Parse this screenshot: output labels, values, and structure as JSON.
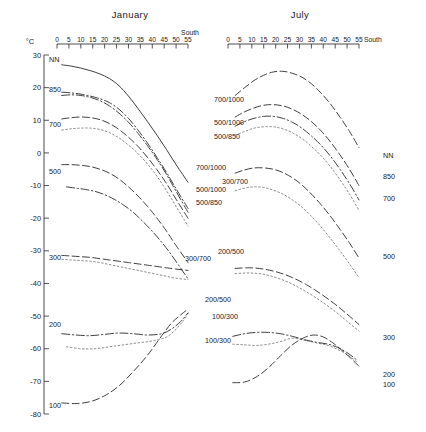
{
  "figure": {
    "unit_label": "°C",
    "panels": [
      {
        "name": "January",
        "title": "January",
        "south_label": "South"
      },
      {
        "name": "July",
        "title": "July",
        "south_label": "South"
      }
    ]
  },
  "chart_data": {
    "type": "line",
    "title": "",
    "xlabel": "South",
    "ylabel": "°C",
    "xlim": [
      0,
      55
    ],
    "ylim": [
      -80,
      30
    ],
    "grid": false,
    "legend": "inline-labels",
    "x_ticks": [
      0,
      5,
      10,
      15,
      20,
      25,
      30,
      35,
      40,
      45,
      50,
      55
    ],
    "y_ticks": [
      30,
      20,
      10,
      0,
      -10,
      -20,
      -30,
      -40,
      -50,
      -60,
      -70,
      -80
    ],
    "panels": [
      {
        "name": "January",
        "left_labels": [
          "NN",
          "850",
          "700",
          "500",
          "300",
          "200",
          "100"
        ],
        "series": [
          {
            "name": "NN",
            "style": "solid",
            "x": [
              2,
              6,
              10,
              14,
              18,
              22,
              26,
              30,
              34,
              38,
              42,
              46,
              50,
              55
            ],
            "y": [
              27.0,
              26.6,
              26.0,
              25.2,
              24.2,
              22.8,
              20.6,
              17.4,
              13.6,
              9.6,
              5.4,
              1.0,
              -3.6,
              -9.0
            ]
          },
          {
            "name": "850",
            "style": "dashdot",
            "x": [
              2,
              6,
              10,
              14,
              18,
              22,
              26,
              30,
              34,
              38,
              42,
              46,
              50,
              55
            ],
            "y": [
              18.6,
              18.4,
              18.0,
              17.4,
              16.6,
              15.4,
              13.4,
              10.6,
              7.0,
              3.0,
              -1.4,
              -6.0,
              -11.0,
              -17.0
            ]
          },
          {
            "name": "700/1000",
            "style": "dashdot",
            "x": [
              2,
              6,
              10,
              14,
              18,
              22,
              26,
              30,
              34,
              38,
              42,
              46,
              50,
              55
            ],
            "y": [
              17.6,
              17.8,
              17.6,
              17.0,
              16.0,
              14.4,
              12.2,
              9.4,
              6.0,
              2.2,
              -2.0,
              -6.6,
              -11.8,
              -18.2
            ]
          },
          {
            "name": "700",
            "style": "longdash",
            "x": [
              2,
              6,
              10,
              14,
              18,
              22,
              26,
              30,
              34,
              38,
              42,
              46,
              50,
              55
            ],
            "y": [
              10.4,
              10.8,
              11.0,
              10.8,
              10.2,
              9.0,
              7.2,
              4.8,
              2.0,
              -1.4,
              -5.2,
              -9.4,
              -14.2,
              -20.0
            ]
          },
          {
            "name": "500/1000",
            "style": "dotted",
            "x": [
              2,
              6,
              10,
              14,
              18,
              22,
              26,
              30,
              34,
              38,
              42,
              46,
              50,
              55
            ],
            "y": [
              7.0,
              7.4,
              7.6,
              7.6,
              7.2,
              6.2,
              4.6,
              2.4,
              -0.2,
              -3.4,
              -7.2,
              -11.6,
              -16.4,
              -22.4
            ]
          },
          {
            "name": "500",
            "style": "longdash",
            "x": [
              2,
              6,
              10,
              14,
              18,
              22,
              26,
              30,
              34,
              38,
              42,
              46,
              50,
              55
            ],
            "y": [
              -3.6,
              -3.6,
              -3.8,
              -4.2,
              -5.0,
              -6.2,
              -8.0,
              -10.4,
              -13.2,
              -16.4,
              -20.0,
              -24.0,
              -28.4,
              -33.6
            ]
          },
          {
            "name": "500/850",
            "style": "dashdot",
            "x": [
              4,
              8,
              12,
              16,
              20,
              24,
              28,
              32,
              36,
              40,
              44,
              48,
              52,
              55
            ],
            "y": [
              -10.4,
              -10.8,
              -11.2,
              -11.8,
              -12.8,
              -14.2,
              -16.0,
              -18.2,
              -21.0,
              -24.0,
              -27.4,
              -31.2,
              -35.4,
              -38.6
            ]
          },
          {
            "name": "300",
            "style": "longdash",
            "x": [
              2,
              6,
              10,
              14,
              18,
              22,
              26,
              30,
              34,
              38,
              42,
              46,
              50,
              55
            ],
            "y": [
              -31.4,
              -31.6,
              -31.8,
              -32.0,
              -32.4,
              -32.8,
              -33.2,
              -33.6,
              -34.0,
              -34.4,
              -34.8,
              -35.2,
              -35.6,
              -36.0
            ]
          },
          {
            "name": "300/700",
            "style": "dotted",
            "x": [
              2,
              6,
              10,
              14,
              18,
              22,
              26,
              30,
              34,
              38,
              42,
              46,
              50,
              55
            ],
            "y": [
              -32.6,
              -32.8,
              -33.0,
              -33.2,
              -33.6,
              -34.2,
              -34.8,
              -35.4,
              -36.0,
              -36.6,
              -37.2,
              -37.8,
              -38.4,
              -38.8
            ]
          },
          {
            "name": "200",
            "style": "dashdot",
            "x": [
              2,
              8,
              14,
              20,
              26,
              32,
              38,
              44,
              48,
              52,
              55
            ],
            "y": [
              -55.4,
              -55.8,
              -56.0,
              -55.6,
              -55.2,
              -55.4,
              -55.8,
              -55.4,
              -54.0,
              -51.6,
              -49.0
            ]
          },
          {
            "name": "200/500",
            "style": "dotted",
            "x": [
              4,
              10,
              16,
              22,
              28,
              34,
              40,
              46,
              50,
              53,
              55
            ],
            "y": [
              -59.4,
              -60.0,
              -60.0,
              -59.4,
              -58.8,
              -58.2,
              -57.6,
              -56.4,
              -54.0,
              -51.4,
              -49.2
            ]
          },
          {
            "name": "100",
            "style": "longdash",
            "x": [
              2,
              8,
              14,
              20,
              26,
              32,
              38,
              44,
              48,
              51,
              54
            ],
            "y": [
              -76.6,
              -76.8,
              -76.2,
              -74.4,
              -71.4,
              -67.0,
              -62.0,
              -56.0,
              -52.2,
              -50.2,
              -48.4
            ]
          }
        ],
        "inline_labels": [
          {
            "text": "700/1000",
            "x": 214,
            "y": 102
          },
          {
            "text": "500/1000",
            "x": 214,
            "y": 125
          },
          {
            "text": "500/850",
            "x": 214,
            "y": 139
          },
          {
            "text": "700/1000",
            "x": 196,
            "y": 170
          },
          {
            "text": "300/700",
            "x": 222,
            "y": 184
          },
          {
            "text": "500/1000",
            "x": 196,
            "y": 192
          },
          {
            "text": "500/850",
            "x": 196,
            "y": 205
          },
          {
            "text": "200/500",
            "x": 218,
            "y": 254
          },
          {
            "text": "300/700",
            "x": 185,
            "y": 261
          },
          {
            "text": "200/500",
            "x": 205,
            "y": 302
          },
          {
            "text": "100/300",
            "x": 212,
            "y": 319
          },
          {
            "text": "100/300",
            "x": 205,
            "y": 343
          }
        ]
      },
      {
        "name": "July",
        "right_labels": [
          "NN",
          "850",
          "700",
          "500",
          "300",
          "200",
          "100"
        ],
        "series": [
          {
            "name": "NN",
            "style": "longdash",
            "x": [
              3,
              7,
              11,
              15,
              19,
              23,
              27,
              31,
              35,
              39,
              43,
              47,
              51,
              55
            ],
            "y": [
              17.6,
              20.0,
              22.2,
              23.8,
              24.8,
              25.0,
              24.4,
              23.2,
              21.2,
              18.4,
              15.0,
              11.0,
              6.6,
              1.6
            ]
          },
          {
            "name": "850",
            "style": "longdash",
            "x": [
              3,
              7,
              11,
              15,
              19,
              23,
              27,
              31,
              35,
              39,
              43,
              47,
              51,
              55
            ],
            "y": [
              11.0,
              12.6,
              13.8,
              14.6,
              14.8,
              14.4,
              13.4,
              11.8,
              9.6,
              6.8,
              3.4,
              -0.6,
              -5.0,
              -10.0
            ]
          },
          {
            "name": "700",
            "style": "dashdot",
            "x": [
              3,
              7,
              11,
              15,
              19,
              23,
              27,
              31,
              35,
              39,
              43,
              47,
              51,
              55
            ],
            "y": [
              8.2,
              9.6,
              10.6,
              11.2,
              11.2,
              10.6,
              9.4,
              7.6,
              5.2,
              2.4,
              -1.0,
              -5.0,
              -9.4,
              -14.4
            ]
          },
          {
            "name": "700b",
            "style": "dotted",
            "x": [
              3,
              7,
              11,
              15,
              19,
              23,
              27,
              31,
              35,
              39,
              43,
              47,
              51,
              55
            ],
            "y": [
              5.4,
              6.6,
              7.6,
              8.0,
              8.0,
              7.4,
              6.2,
              4.4,
              2.0,
              -0.8,
              -4.2,
              -8.2,
              -12.6,
              -17.6
            ]
          },
          {
            "name": "500",
            "style": "longdash",
            "x": [
              3,
              7,
              11,
              15,
              19,
              23,
              27,
              31,
              35,
              39,
              43,
              47,
              51,
              55
            ],
            "y": [
              -6.2,
              -5.2,
              -4.6,
              -4.6,
              -5.0,
              -6.0,
              -7.6,
              -9.8,
              -12.6,
              -15.8,
              -19.4,
              -23.4,
              -27.6,
              -32.2
            ]
          },
          {
            "name": "500b",
            "style": "dotted",
            "x": [
              3,
              7,
              11,
              15,
              19,
              23,
              27,
              31,
              35,
              39,
              43,
              47,
              51,
              55
            ],
            "y": [
              -11.6,
              -10.8,
              -10.4,
              -10.6,
              -11.4,
              -12.6,
              -14.4,
              -16.6,
              -19.4,
              -22.6,
              -26.2,
              -30.0,
              -34.0,
              -38.2
            ]
          },
          {
            "name": "300",
            "style": "longdash",
            "x": [
              3,
              9,
              15,
              21,
              27,
              33,
              39,
              45,
              50,
              55
            ],
            "y": [
              -35.4,
              -35.2,
              -35.6,
              -36.6,
              -38.2,
              -40.4,
              -43.2,
              -46.4,
              -49.4,
              -52.6
            ]
          },
          {
            "name": "300b",
            "style": "dotted",
            "x": [
              3,
              9,
              15,
              21,
              27,
              33,
              39,
              45,
              50,
              55
            ],
            "y": [
              -37.0,
              -36.8,
              -37.2,
              -38.4,
              -40.2,
              -42.6,
              -45.4,
              -48.6,
              -51.6,
              -54.6
            ]
          },
          {
            "name": "200",
            "style": "dashdot",
            "x": [
              2,
              7,
              12,
              17,
              22,
              27,
              32,
              37,
              42,
              46,
              50,
              54
            ],
            "y": [
              -56.2,
              -55.4,
              -55.0,
              -55.0,
              -55.4,
              -56.2,
              -57.2,
              -58.0,
              -58.6,
              -59.6,
              -61.2,
              -63.4
            ]
          },
          {
            "name": "100/300",
            "style": "dotted",
            "x": [
              2,
              7,
              12,
              17,
              22,
              27,
              32,
              37,
              42,
              46,
              50,
              54
            ],
            "y": [
              -58.6,
              -58.8,
              -59.0,
              -58.6,
              -57.8,
              -56.8,
              -57.4,
              -58.2,
              -59.0,
              -60.2,
              -61.8,
              -64.0
            ]
          },
          {
            "name": "100",
            "style": "longdash",
            "x": [
              2,
              7,
              12,
              17,
              22,
              27,
              32,
              36,
              40,
              44,
              48,
              52,
              55
            ],
            "y": [
              -70.4,
              -70.2,
              -68.6,
              -65.8,
              -62.2,
              -58.8,
              -56.6,
              -55.8,
              -56.4,
              -58.2,
              -60.6,
              -63.2,
              -65.4
            ]
          }
        ],
        "inline_labels": []
      }
    ],
    "annotations": [
      "NN",
      "850",
      "700",
      "500",
      "300",
      "200",
      "100",
      "700/1000",
      "500/1000",
      "500/850",
      "300/700",
      "200/500",
      "100/300"
    ]
  }
}
